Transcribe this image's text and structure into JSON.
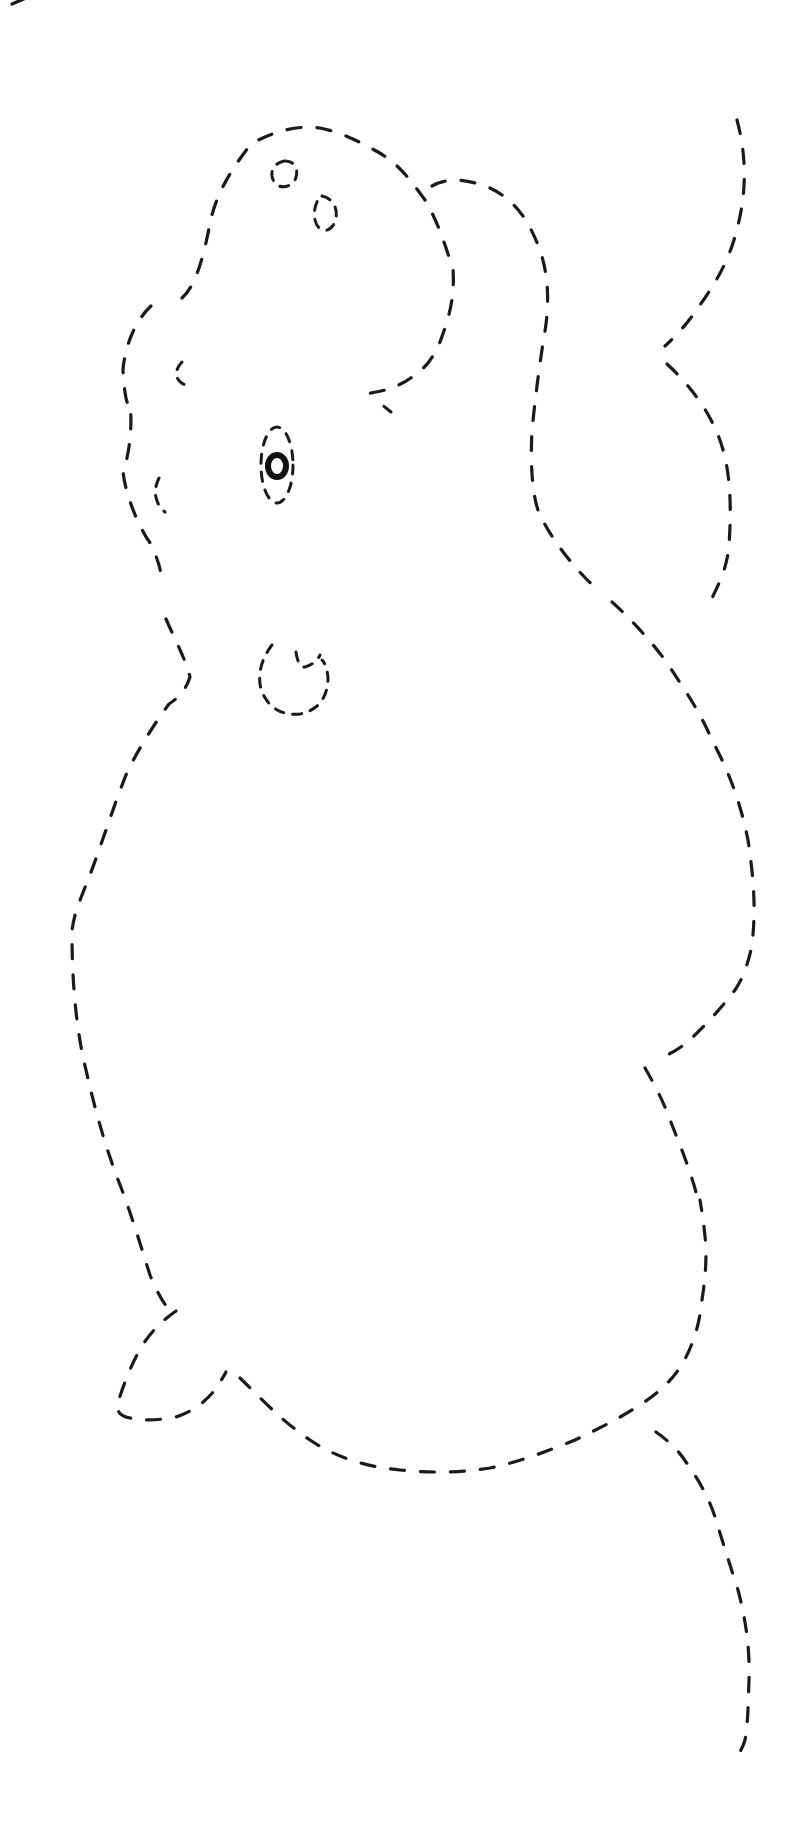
{
  "worksheet": {
    "title": "Dashed-line tracing worksheet: elephant",
    "subject": "elephant",
    "line_style": "dashed",
    "stroke_color": "#1a1a1a",
    "background_color": "#ffffff",
    "parts": [
      "trunk",
      "head",
      "ear",
      "eye",
      "mouth",
      "body",
      "front-leg",
      "back",
      "tail",
      "nostrils"
    ]
  }
}
